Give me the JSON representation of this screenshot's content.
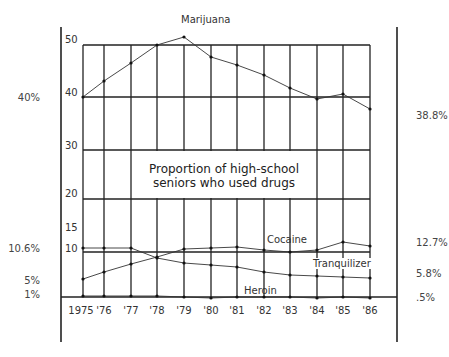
{
  "chart_data": {
    "type": "line",
    "title": "Proportion of high-school seniors who used drugs",
    "title_lines": [
      "Proportion of high-school",
      "seniors who used drugs"
    ],
    "xlabel": "",
    "ylabel": "",
    "categories": [
      "1975",
      "'76",
      "'77",
      "'78",
      "'79",
      "'80",
      "'81",
      "'82",
      "'83",
      "'84",
      "'85",
      "'86"
    ],
    "y_ticks": [
      "50",
      "40",
      "30",
      "20",
      "15",
      "10"
    ],
    "ylim": [
      0,
      50
    ],
    "grid": true,
    "legend": "inline labels",
    "series": [
      {
        "name": "Marijuana",
        "values": [
          40,
          43,
          46.5,
          50,
          51.5,
          48,
          46,
          44,
          41.5,
          39.5,
          40.5,
          38.8
        ],
        "start_label": "40%",
        "end_label": "38.8%"
      },
      {
        "name": "Tranquilizer",
        "values": [
          10.6,
          10.6,
          10.5,
          9.5,
          8.6,
          8.3,
          8.0,
          7.2,
          6.7,
          6.2,
          6.1,
          5.8
        ],
        "start_label": "10.6%",
        "end_label": "5.8%"
      },
      {
        "name": "Cocaine",
        "values": [
          5,
          6.5,
          7.8,
          9.5,
          10.8,
          11.3,
          11.6,
          11.0,
          10.6,
          10.9,
          13.5,
          12.7
        ],
        "start_label": "5%",
        "end_label": "12.7%"
      },
      {
        "name": "Heroin",
        "values": [
          1,
          1,
          1,
          0.9,
          0.7,
          0.6,
          0.6,
          0.6,
          0.6,
          0.5,
          0.6,
          0.5
        ],
        "start_label": "1%",
        "end_label": ".5%"
      }
    ]
  },
  "layout": {
    "col_x": [
      83,
      104,
      131,
      157,
      184,
      211,
      237,
      264,
      290,
      317,
      343,
      370
    ],
    "grid_y": {
      "50": 45,
      "40": 97,
      "30": 150,
      "20": 199,
      "10": 252,
      "0": 297
    },
    "series_px": {
      "Marijuana": [
        97,
        81,
        63,
        45,
        37,
        57,
        65,
        75,
        88,
        99,
        94,
        109
      ],
      "Tranquilizer": [
        248,
        248,
        248,
        258,
        263,
        265,
        267,
        272,
        275,
        276,
        277,
        278
      ],
      "Cocaine": [
        279,
        272,
        264,
        257,
        249,
        248,
        247,
        250,
        252,
        250,
        242,
        246
      ],
      "Heroin": [
        296,
        296,
        296,
        296,
        297,
        298,
        297,
        297,
        297,
        298,
        297,
        298
      ]
    }
  },
  "labels": {
    "left_percent": [
      {
        "text": "40%",
        "y": 92
      },
      {
        "text": "10.6%",
        "y": 243
      },
      {
        "text": "5%",
        "y": 275
      },
      {
        "text": "1%",
        "y": 289
      }
    ],
    "right_percent": [
      {
        "text": "38.8%",
        "y": 110
      },
      {
        "text": "12.7%",
        "y": 237
      },
      {
        "text": "5.8%",
        "y": 268
      },
      {
        "text": ".5%",
        "y": 292
      }
    ],
    "series_inline": [
      {
        "text": "Marijuana",
        "x": 181,
        "y": 14
      },
      {
        "text": "Cocaine",
        "x": 267,
        "y": 234
      },
      {
        "text": "Tranquilizer",
        "x": 313,
        "y": 258
      },
      {
        "text": "Heroin",
        "x": 244,
        "y": 285
      }
    ]
  }
}
